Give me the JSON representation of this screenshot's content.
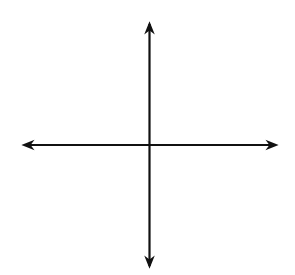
{
  "chart_data": {
    "type": "line",
    "title": "",
    "equation": "y^2 - x^2 = 1",
    "xlabel": "x",
    "ylabel": "y",
    "xlim": [
      -4,
      4
    ],
    "ylim": [
      -4,
      4
    ],
    "grid": true,
    "grid_step": 1,
    "tick_labels": [
      {
        "text": "2",
        "axis": "y",
        "value": 2
      },
      {
        "text": "−1",
        "axis": "y",
        "value": -1
      }
    ],
    "series": [
      {
        "name": "upper branch",
        "x": [
          -3.85,
          -3,
          -2,
          -1,
          0,
          1,
          2,
          3,
          3.85
        ],
        "y": [
          3.98,
          3.16,
          2.24,
          1.41,
          1,
          1.41,
          2.24,
          3.16,
          3.98
        ]
      },
      {
        "name": "lower branch",
        "x": [
          -3.85,
          -3,
          -2,
          -1,
          0,
          1,
          2,
          3,
          3.85
        ],
        "y": [
          -3.98,
          -3.16,
          -2.24,
          -1.41,
          -1,
          -1.41,
          -2.24,
          -3.16,
          -3.98
        ]
      }
    ],
    "colors": {
      "curve": "#555555",
      "axis": "#111111",
      "grid": "#cfcfcf"
    }
  },
  "labels": {
    "x_axis": "x",
    "y_axis": "y",
    "tick_2": "2",
    "tick_neg1": "−1"
  }
}
